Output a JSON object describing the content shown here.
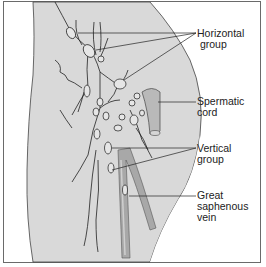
{
  "diagram": {
    "labels": {
      "horizontal_group": "Horizontal\n group",
      "spermatic_cord": "Spermatic\ncord",
      "vertical_group": "Vertical\ngroup",
      "great_saphenous_vein": "Great\nsaphenous\nvein"
    },
    "colors": {
      "background": "#ffffff",
      "thigh_fill": "#d9d9d9",
      "outline": "#333333",
      "node_fill": "#e6e6e6",
      "vein_fill": "#a8a8a8",
      "cord_fill": "#b9b9b9",
      "frame": "#6a6a6a"
    }
  }
}
